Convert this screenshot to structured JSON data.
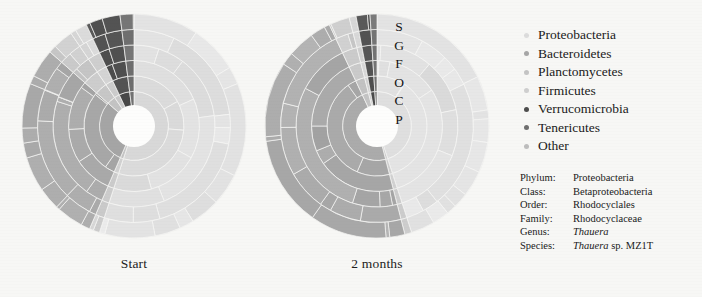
{
  "figure": {
    "background_color": "#f7f7f5",
    "panels": [
      {
        "id": "start",
        "caption": "Start"
      },
      {
        "id": "2months",
        "caption": "2 months"
      }
    ]
  },
  "rank_letters": {
    "title": "taxonomic rank rings, outermost to innermost",
    "items": [
      "S",
      "G",
      "F",
      "O",
      "C",
      "P"
    ]
  },
  "legend": {
    "items": [
      {
        "label": "Proteobacteria",
        "color": "#dcdcdc"
      },
      {
        "label": "Bacteroidetes",
        "color": "#a6a6a6"
      },
      {
        "label": "Planctomycetes",
        "color": "#c4c4c4"
      },
      {
        "label": "Firmicutes",
        "color": "#cfcfcf"
      },
      {
        "label": "Verrucomicrobia",
        "color": "#4d4d4d"
      },
      {
        "label": "Tenericutes",
        "color": "#6f6f6f"
      },
      {
        "label": "Other",
        "color": "#bdbdbd"
      }
    ]
  },
  "taxonomy": {
    "rows": [
      {
        "rank": "Phylum:",
        "value": "Proteobacteria",
        "italic": false
      },
      {
        "rank": "Class:",
        "value": "Betaproteobacteria",
        "italic": false
      },
      {
        "rank": "Order:",
        "value": "Rhodocyclales",
        "italic": false
      },
      {
        "rank": "Family:",
        "value": "Rhodocyclaceae",
        "italic": false
      },
      {
        "rank": "Genus:",
        "value": "Thauera",
        "italic": true
      },
      {
        "rank": "Species:",
        "value": "Thauera sp. MZ1T",
        "italic": true
      }
    ]
  },
  "chart_data": {
    "type": "pie",
    "subtype": "sunburst",
    "title": "",
    "legend_position": "right",
    "rings": [
      "P",
      "C",
      "O",
      "F",
      "G",
      "S"
    ],
    "ring_count": 6,
    "inner_hole_fraction": 0.17,
    "outer_radius_px": 112,
    "start_angle_deg": 0,
    "direction": "clockwise",
    "charts": [
      {
        "name": "Start",
        "phyla": [
          {
            "label": "Proteobacteria",
            "value": 55.0,
            "color": "#dcdcdc"
          },
          {
            "label": "Other",
            "value": 1.5,
            "color": "#c9c9c9"
          },
          {
            "label": "Bacteroidetes",
            "value": 30.0,
            "color": "#a6a6a6"
          },
          {
            "label": "Planctomycetes",
            "value": 4.0,
            "color": "#c4c4c4"
          },
          {
            "label": "Firmicutes",
            "value": 2.5,
            "color": "#cfcfcf"
          },
          {
            "label": "Verrucomicrobia",
            "value": 5.0,
            "color": "#4d4d4d"
          },
          {
            "label": "Tenericutes",
            "value": 2.0,
            "color": "#6f6f6f"
          }
        ],
        "subdivisions_per_ring": [
          1,
          2,
          3,
          4,
          6,
          9
        ]
      },
      {
        "name": "2 months",
        "phyla": [
          {
            "label": "Proteobacteria",
            "value": 45.0,
            "color": "#dcdcdc"
          },
          {
            "label": "Other",
            "value": 1.0,
            "color": "#c9c9c9"
          },
          {
            "label": "Bacteroidetes",
            "value": 47.0,
            "color": "#a6a6a6"
          },
          {
            "label": "Planctomycetes",
            "value": 3.0,
            "color": "#c4c4c4"
          },
          {
            "label": "Firmicutes",
            "value": 1.0,
            "color": "#cfcfcf"
          },
          {
            "label": "Verrucomicrobia",
            "value": 2.0,
            "color": "#4d4d4d"
          },
          {
            "label": "Tenericutes",
            "value": 1.0,
            "color": "#6f6f6f"
          }
        ],
        "subdivisions_per_ring": [
          1,
          2,
          3,
          4,
          6,
          9
        ]
      }
    ]
  }
}
